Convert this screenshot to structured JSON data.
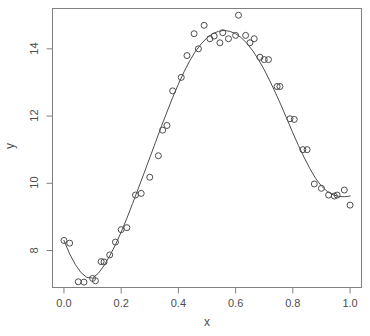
{
  "chart_data": {
    "type": "scatter",
    "title": "",
    "subtitle": "",
    "xlabel": "x",
    "ylabel": "y",
    "xlim": [
      -0.04,
      1.04
    ],
    "ylim": [
      6.9,
      15.2
    ],
    "grid": false,
    "legend": null,
    "x_ticks": [
      0.0,
      0.2,
      0.4,
      0.6,
      0.8,
      1.0
    ],
    "x_tick_labels": [
      "0.0",
      "0.2",
      "0.4",
      "0.6",
      "0.8",
      "1.0"
    ],
    "y_ticks": [
      8,
      10,
      12,
      14
    ],
    "y_tick_labels": [
      "8",
      "10",
      "12",
      "14"
    ],
    "point_marker": "open-circle",
    "point_color": "#4d4d4d",
    "line_color": "#4d4d4d",
    "box_color": "#808080",
    "series": [
      {
        "name": "observations",
        "type": "scatter",
        "x": [
          0.0,
          0.02,
          0.05,
          0.07,
          0.1,
          0.11,
          0.13,
          0.14,
          0.16,
          0.18,
          0.2,
          0.22,
          0.25,
          0.27,
          0.3,
          0.33,
          0.345,
          0.36,
          0.38,
          0.41,
          0.43,
          0.455,
          0.47,
          0.49,
          0.51,
          0.525,
          0.545,
          0.555,
          0.575,
          0.6,
          0.61,
          0.635,
          0.65,
          0.665,
          0.685,
          0.7,
          0.715,
          0.745,
          0.755,
          0.79,
          0.805,
          0.835,
          0.85,
          0.875,
          0.9,
          0.925,
          0.945,
          0.955,
          0.98,
          1.0
        ],
        "y": [
          8.3,
          8.22,
          7.07,
          7.06,
          7.17,
          7.1,
          7.67,
          7.66,
          7.87,
          8.25,
          8.62,
          8.68,
          9.65,
          9.7,
          10.18,
          10.82,
          11.58,
          11.72,
          12.75,
          13.15,
          13.8,
          14.45,
          14.0,
          14.7,
          14.3,
          14.38,
          14.18,
          14.48,
          14.3,
          14.4,
          15.0,
          14.4,
          14.18,
          14.3,
          13.75,
          13.68,
          13.68,
          12.88,
          12.88,
          11.92,
          11.9,
          11.0,
          11.0,
          9.98,
          9.85,
          9.65,
          9.62,
          9.65,
          9.8,
          9.35
        ]
      },
      {
        "name": "fitted-smooth-curve",
        "type": "line",
        "x": [
          0.0,
          0.02,
          0.04,
          0.06,
          0.08,
          0.1,
          0.12,
          0.14,
          0.16,
          0.18,
          0.2,
          0.22,
          0.24,
          0.26,
          0.28,
          0.3,
          0.32,
          0.34,
          0.36,
          0.38,
          0.4,
          0.42,
          0.44,
          0.46,
          0.48,
          0.5,
          0.52,
          0.54,
          0.56,
          0.58,
          0.6,
          0.62,
          0.64,
          0.66,
          0.68,
          0.7,
          0.72,
          0.74,
          0.76,
          0.78,
          0.8,
          0.82,
          0.84,
          0.86,
          0.88,
          0.9,
          0.92,
          0.94,
          0.96,
          0.98,
          1.0
        ],
        "y": [
          8.3,
          7.9,
          7.58,
          7.34,
          7.2,
          7.18,
          7.32,
          7.55,
          7.84,
          8.17,
          8.55,
          8.96,
          9.4,
          9.85,
          10.3,
          10.76,
          11.22,
          11.68,
          12.12,
          12.55,
          12.95,
          13.32,
          13.65,
          13.93,
          14.15,
          14.33,
          14.45,
          14.52,
          14.55,
          14.52,
          14.45,
          14.33,
          14.16,
          13.94,
          13.68,
          13.38,
          13.04,
          12.68,
          12.3,
          11.9,
          11.5,
          11.12,
          10.76,
          10.43,
          10.14,
          9.92,
          9.76,
          9.66,
          9.61,
          9.6,
          9.62
        ]
      }
    ]
  },
  "axes": {
    "x_title": "x",
    "y_title": "y"
  }
}
